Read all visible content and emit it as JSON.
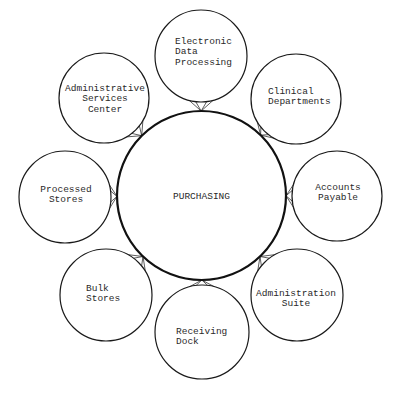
{
  "diagram": {
    "center": {
      "label": "PURCHASING"
    },
    "nodes": [
      {
        "id": "edp",
        "position": "top",
        "lines": [
          "Electronic",
          "Data",
          "Processing"
        ]
      },
      {
        "id": "clinical",
        "position": "top-right",
        "lines": [
          "Clinical",
          "Departments"
        ]
      },
      {
        "id": "accounts",
        "position": "right",
        "lines": [
          "Accounts",
          "Payable"
        ]
      },
      {
        "id": "admin-suite",
        "position": "bottom-right",
        "lines": [
          "Administration",
          "Suite"
        ]
      },
      {
        "id": "receiving",
        "position": "bottom",
        "lines": [
          "Receiving",
          "Dock"
        ]
      },
      {
        "id": "bulk",
        "position": "bottom-left",
        "lines": [
          "Bulk",
          "Stores"
        ]
      },
      {
        "id": "processed",
        "position": "left",
        "lines": [
          "Processed",
          "Stores"
        ]
      },
      {
        "id": "asc",
        "position": "top-left",
        "lines": [
          "Administrative",
          "Services",
          "Center"
        ]
      }
    ],
    "edges": [
      {
        "from": "edp",
        "to": "center"
      },
      {
        "from": "clinical",
        "to": "center"
      },
      {
        "from": "accounts",
        "to": "center"
      },
      {
        "from": "admin-suite",
        "to": "center"
      },
      {
        "from": "receiving",
        "to": "center"
      },
      {
        "from": "bulk",
        "to": "center"
      },
      {
        "from": "processed",
        "to": "center"
      },
      {
        "from": "asc",
        "to": "center"
      }
    ],
    "colors": {
      "stroke": "#1a1a1a",
      "text": "#2a2a2a",
      "background": "#ffffff"
    }
  }
}
